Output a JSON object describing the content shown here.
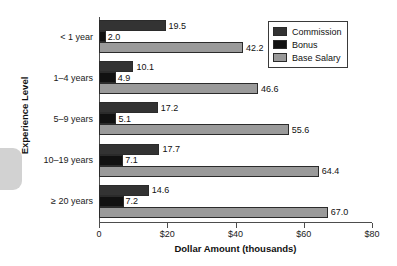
{
  "chart_data": {
    "type": "bar",
    "orientation": "horizontal",
    "title": "",
    "xlabel": "Dollar Amount (thousands)",
    "ylabel": "Experience Level",
    "xlim": [
      0,
      80
    ],
    "xticks": [
      0,
      20,
      40,
      60,
      80
    ],
    "xtick_labels": [
      "0",
      "$20",
      "$40",
      "$60",
      "$80"
    ],
    "grid": false,
    "legend_position": "top-right",
    "categories": [
      "< 1 year",
      "1–4 years",
      "5–9 years",
      "10–19 years",
      "≥ 20 years"
    ],
    "series": [
      {
        "name": "Commission",
        "color": "#333333",
        "values": [
          19.5,
          10.1,
          17.2,
          17.7,
          14.6
        ],
        "labels": [
          "19.5",
          "10.1",
          "17.2",
          "17.7",
          "14.6"
        ]
      },
      {
        "name": "Bonus",
        "color": "#111111",
        "values": [
          2.0,
          4.9,
          5.1,
          7.1,
          7.2
        ],
        "labels": [
          "2.0",
          "4.9",
          "5.1",
          "7.1",
          "7.2"
        ]
      },
      {
        "name": "Base Salary",
        "color": "#9a9a9a",
        "values": [
          42.2,
          46.6,
          55.6,
          64.4,
          67.0
        ],
        "labels": [
          "42.2",
          "46.6",
          "55.6",
          "64.4",
          "67.0"
        ]
      }
    ]
  },
  "axis": {
    "x_title": "Dollar Amount (thousands)",
    "y_title": "Experience Level",
    "x_tick_labels": [
      "0",
      "$20",
      "$40",
      "$60",
      "$80"
    ],
    "y_tick_labels": [
      "< 1 year",
      "1–4 years",
      "5–9 years",
      "10–19 years",
      "≥ 20 years"
    ]
  },
  "legend": {
    "items": [
      {
        "label": "Commission",
        "color": "#333333"
      },
      {
        "label": "Bonus",
        "color": "#111111"
      },
      {
        "label": "Base Salary",
        "color": "#9a9a9a"
      }
    ]
  }
}
